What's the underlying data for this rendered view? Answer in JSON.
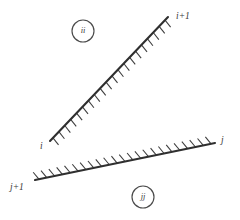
{
  "figure": {
    "background_color": "#ffffff",
    "width": 240,
    "height": 220,
    "line_color": "#2f2f2f",
    "hatch_color": "#3c3c3c",
    "text_color": "#3a3a3a",
    "circle_color": "#4a4a4a"
  },
  "panels": [
    {
      "id": "panel-i",
      "name": "upper-panel",
      "tag": "ii",
      "tag_circle": {
        "cx": 83,
        "cy": 31,
        "r": 11
      },
      "start": {
        "x": 50,
        "y": 141
      },
      "end": {
        "x": 168,
        "y": 17
      },
      "start_label": "i",
      "end_label": "i+1",
      "start_label_pos": {
        "x": 40,
        "y": 149
      },
      "end_label_pos": {
        "x": 176,
        "y": 19
      },
      "hatch_side": "upper-left",
      "hatch_count": 20,
      "hatch_length": 9,
      "hatch_angle_deg": 98
    },
    {
      "id": "panel-j",
      "name": "lower-panel",
      "tag": "jj",
      "tag_circle": {
        "cx": 143,
        "cy": 197,
        "r": 11
      },
      "start": {
        "x": 35,
        "y": 180
      },
      "end": {
        "x": 215,
        "y": 143
      },
      "start_label": "j+1",
      "end_label": "j",
      "start_label_pos": {
        "x": 10,
        "y": 190
      },
      "end_label_pos": {
        "x": 221,
        "y": 143
      },
      "hatch_side": "lower-right",
      "hatch_count": 23,
      "hatch_length": 9,
      "hatch_angle_deg": 62
    }
  ]
}
